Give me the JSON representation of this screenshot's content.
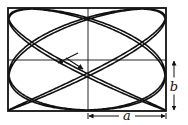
{
  "figure": {
    "type": "lissajous-figure",
    "box": {
      "left": 8,
      "top": 8,
      "right": 166,
      "bottom": 111
    },
    "center": {
      "x": 88,
      "y": 60
    },
    "curve": {
      "freq_x": 5,
      "freq_y": 4,
      "phase": 0.35,
      "drift": 0.0,
      "samples": 1600,
      "stroke": "#111111",
      "stroke_width": 1.6
    },
    "box_stroke": "#111111",
    "labels": {
      "a": "a",
      "b": "b"
    },
    "dimension_a": {
      "from_x": 88,
      "to_x": 166,
      "y": 116
    },
    "dimension_b": {
      "x": 174,
      "from_y": 60,
      "to_y": 111
    },
    "direction_arrows": [
      {
        "x1": 78,
        "y1": 53,
        "x2": 58,
        "y2": 63
      },
      {
        "x1": 66,
        "y1": 58,
        "x2": 83,
        "y2": 69
      }
    ]
  }
}
